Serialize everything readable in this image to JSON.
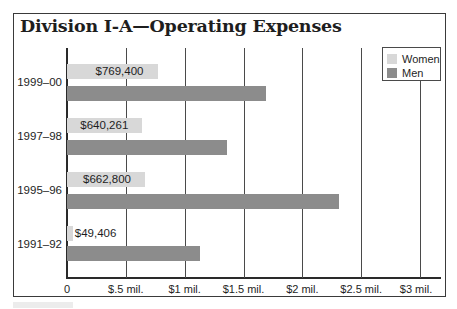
{
  "chart_data": {
    "type": "bar",
    "orientation": "horizontal",
    "title": "Division I-A—Operating Expenses",
    "categories": [
      "1999–00",
      "1997–98",
      "1995–96",
      "1991–92"
    ],
    "series": [
      {
        "name": "Women",
        "color": "#d8d8d8",
        "values": [
          769400,
          640261,
          662800,
          49406
        ],
        "labels": [
          "$769,400",
          "$640,261",
          "$662,800",
          "$49,406"
        ]
      },
      {
        "name": "Men",
        "color": "#8c8c8c",
        "values": [
          1690000,
          1360000,
          2310000,
          1130000
        ]
      }
    ],
    "xlabel": "",
    "ylabel": "",
    "xlim": [
      0,
      3000000
    ],
    "x_ticks": [
      0,
      500000,
      1000000,
      1500000,
      2000000,
      2500000,
      3000000
    ],
    "x_tick_labels": [
      "0",
      "$.5 mil.",
      "$1 mil.",
      "$1.5 mil.",
      "$2 mil.",
      "$2.5 mil.",
      "$3 mil."
    ],
    "grid": "vertical",
    "legend_position": "top-right",
    "legend": [
      "Women",
      "Men"
    ]
  }
}
